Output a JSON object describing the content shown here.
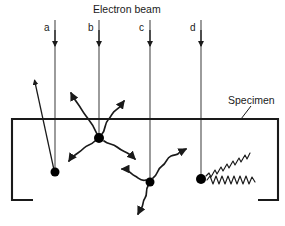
{
  "figure": {
    "type": "scientific-diagram",
    "background_color": "#ffffff",
    "stroke_color": "#1a1a1a",
    "title": "Electron beam",
    "specimen_label": "Specimen"
  },
  "beams": [
    {
      "id": "a",
      "label": "a",
      "x": 55,
      "label_x": 45,
      "label_y": 24,
      "arrow_tip_y": 46,
      "line_top": 20,
      "line_bottom": 172
    },
    {
      "id": "b",
      "label": "b",
      "x": 99,
      "label_x": 89,
      "label_y": 24,
      "arrow_tip_y": 46,
      "line_top": 20,
      "line_bottom": 138
    },
    {
      "id": "c",
      "label": "c",
      "x": 150,
      "label_x": 140,
      "label_y": 24,
      "arrow_tip_y": 46,
      "line_top": 20,
      "line_bottom": 182
    },
    {
      "id": "d",
      "label": "d",
      "x": 201,
      "label_x": 191,
      "label_y": 24,
      "arrow_tip_y": 46,
      "line_top": 20,
      "line_bottom": 179
    }
  ],
  "specimen_box": {
    "left": 12,
    "right": 278,
    "top": 119,
    "bottom": 200,
    "bottom_left_stub_end": 33,
    "bottom_right_stub_start": 258
  },
  "interaction_points": [
    {
      "id": "point-a",
      "x": 55,
      "y": 172,
      "radius": 4.5,
      "kind": "backscatter-site"
    },
    {
      "id": "point-b",
      "x": 99,
      "y": 138,
      "radius": 5.0,
      "kind": "secondary-electron-site"
    },
    {
      "id": "point-c",
      "x": 150,
      "y": 182,
      "radius": 4.5,
      "kind": "secondary-electron-site"
    },
    {
      "id": "point-d",
      "x": 201,
      "y": 179,
      "radius": 5.0,
      "kind": "x-ray-site"
    }
  ],
  "emissions": {
    "backscattered": [
      {
        "from": "point-a",
        "tip_x": 34,
        "tip_y": 78,
        "style": "straight"
      }
    ],
    "secondary_b": [
      {
        "dir": "up-left",
        "tip_x": 70,
        "tip_y": 90,
        "style": "wavy"
      },
      {
        "dir": "up-right",
        "tip_x": 126,
        "tip_y": 99,
        "style": "wavy"
      },
      {
        "dir": "down-left",
        "tip_x": 68,
        "tip_y": 163,
        "style": "wavy"
      },
      {
        "dir": "down-right",
        "tip_x": 137,
        "tip_y": 161,
        "style": "wavy"
      }
    ],
    "secondary_c": [
      {
        "dir": "up-left",
        "tip_x": 121,
        "tip_y": 168,
        "style": "wavy"
      },
      {
        "dir": "up-right",
        "tip_x": 188,
        "tip_y": 148,
        "style": "wavy"
      },
      {
        "dir": "down",
        "tip_x": 137,
        "tip_y": 216,
        "style": "wavy"
      }
    ],
    "xrays_d": [
      {
        "dir": "up-right",
        "tip_x": 250,
        "tip_y": 135,
        "style": "zigzag"
      },
      {
        "dir": "horizontal",
        "tip_x": 258,
        "tip_y": 180,
        "style": "zigzag"
      }
    ]
  },
  "leader_lines": [
    {
      "name": "specimen-leader",
      "x1": 250,
      "y1": 108,
      "x2": 240,
      "y2": 120
    }
  ],
  "labels": {
    "title": {
      "text": "Electron beam",
      "x": 93,
      "y": 5
    },
    "specimen": {
      "text": "Specimen",
      "x": 228,
      "y": 96
    }
  }
}
